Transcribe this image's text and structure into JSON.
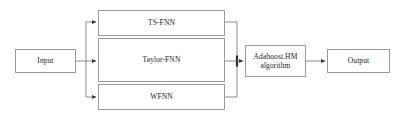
{
  "diagram": {
    "colors": {
      "border": "#9a9a9a",
      "wire": "#8c8c8c",
      "text": "#1a1a1a",
      "background": "#ffffff"
    },
    "nodes": [
      {
        "id": "input",
        "label": "Input",
        "role": "source"
      },
      {
        "id": "ts_fnn",
        "label": "TS-FNN",
        "role": "branch"
      },
      {
        "id": "taylor_fnn",
        "label": "Taylor-FNN",
        "role": "branch"
      },
      {
        "id": "wfnn",
        "label": "WFNN",
        "role": "branch"
      },
      {
        "id": "adaboost",
        "label": "Adaboost.HM\nalgorithm",
        "role": "combiner"
      },
      {
        "id": "output",
        "label": "Output",
        "role": "sink"
      }
    ],
    "edges": [
      {
        "from": "input",
        "to": "ts_fnn",
        "style": "arrow"
      },
      {
        "from": "input",
        "to": "taylor_fnn",
        "style": "arrow"
      },
      {
        "from": "input",
        "to": "wfnn",
        "style": "arrow"
      },
      {
        "from": "ts_fnn",
        "to": "adaboost",
        "style": "bus"
      },
      {
        "from": "taylor_fnn",
        "to": "adaboost",
        "style": "arrow"
      },
      {
        "from": "wfnn",
        "to": "adaboost",
        "style": "bus"
      },
      {
        "from": "adaboost",
        "to": "output",
        "style": "arrow"
      }
    ]
  }
}
